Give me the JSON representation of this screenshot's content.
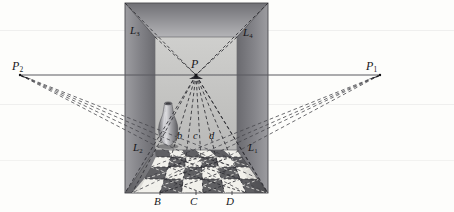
{
  "figure": {
    "type": "perspective-geometry-diagram",
    "width": 454,
    "height": 212,
    "background_color": "#fdfdfb"
  },
  "colors": {
    "ink": "#17171a",
    "horizon_line": "#5a5a60",
    "wall_left_dark": "#6f6f73",
    "wall_left_light": "#a9a9ad",
    "wall_right_dark": "#6e6e72",
    "wall_right_light": "#a8a8ac",
    "ceiling_dark": "#7a7a7e",
    "ceiling_light": "#b0b0b4",
    "back_wall": "#c3c3c2",
    "floor_dark_tile": "#5f5f63",
    "floor_light_tile": "#f2f1ec",
    "floor_mid_tile": "#8f8f93",
    "vase_body": "#9a9a9e",
    "vase_highlight": "#d5d5d8",
    "vase_shadow": "#58585c",
    "dashed_line": "#3a3a3e"
  },
  "points": {
    "vanishing_center": {
      "label": "P",
      "x": 196,
      "y": 75
    },
    "vanishing_left": {
      "label": "P",
      "sub": "2",
      "x": 20,
      "y": 75
    },
    "vanishing_right": {
      "label": "P",
      "sub": "1",
      "x": 380,
      "y": 75
    }
  },
  "labels": {
    "P": {
      "text": "P",
      "sub": "",
      "x": 191,
      "y": 60
    },
    "P1": {
      "text": "P",
      "sub": "1",
      "x": 368,
      "y": 62
    },
    "P2": {
      "text": "P",
      "sub": "2",
      "x": 13,
      "y": 62
    },
    "L1": {
      "text": "L",
      "sub": "1",
      "x": 249,
      "y": 143
    },
    "L2": {
      "text": "L",
      "sub": "2",
      "x": 134,
      "y": 143
    },
    "L3": {
      "text": "L",
      "sub": "3",
      "x": 130,
      "y": 26
    },
    "L4": {
      "text": "L",
      "sub": "4",
      "x": 243,
      "y": 28
    },
    "b": {
      "text": "b",
      "sub": "",
      "x": 177,
      "y": 130
    },
    "c": {
      "text": "c",
      "sub": "",
      "x": 193,
      "y": 130
    },
    "d": {
      "text": "d",
      "sub": "",
      "x": 209,
      "y": 130
    },
    "B": {
      "text": "B",
      "sub": "",
      "x": 154,
      "y": 191
    },
    "C": {
      "text": "C",
      "sub": "",
      "x": 190,
      "y": 191
    },
    "D": {
      "text": "D",
      "sub": "",
      "x": 226,
      "y": 191
    }
  },
  "geometry": {
    "room_outer": {
      "left": 125,
      "right": 268,
      "top": 3,
      "bottom": 193
    },
    "back_wall": {
      "left": 155,
      "right": 237,
      "top": 37,
      "bottom": 150
    },
    "horizon_y": 75,
    "horizon_x_start": 20,
    "horizon_x_end": 380,
    "floor_front_y": 193,
    "floor_back_y": 150,
    "tile_columns": 6,
    "tile_rows": 4,
    "front_edge_marks_x": [
      158,
      194,
      230
    ],
    "back_edge_marks_x": [
      180,
      196,
      212
    ]
  },
  "vase": {
    "center_x": 168,
    "top_y": 103,
    "bottom_y": 146,
    "max_width": 17
  },
  "annotations": {
    "dashed_convergence_note": "All tile edge lines converge at P; diagonals converge at P1 and P2",
    "solid_lines": [
      "horizon",
      "room edges",
      "back wall outline"
    ],
    "dashed_lines": [
      "tile orthogonals to P",
      "tile diagonals to P1",
      "tile diagonals to P2"
    ]
  }
}
